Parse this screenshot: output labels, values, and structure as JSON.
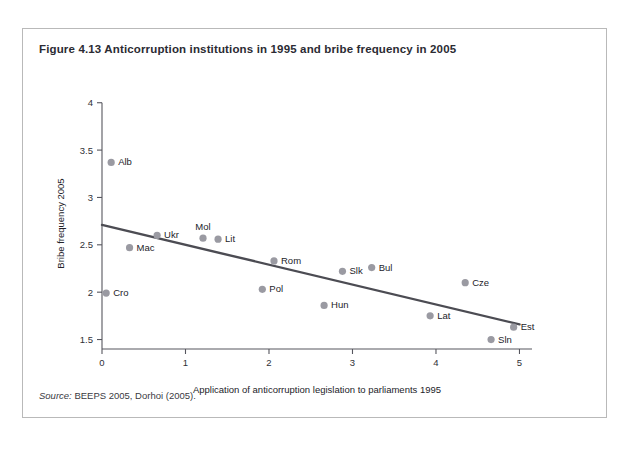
{
  "figure": {
    "title": "Figure 4.13  Anticorruption institutions in 1995 and bribe frequency in 2005",
    "source_label": "Source:",
    "source_text": " BEEPS 2005, Dorhoi (2005)."
  },
  "chart_data": {
    "type": "scatter",
    "title": "Figure 4.13  Anticorruption institutions in 1995 and bribe frequency in 2005",
    "xlabel": "Application of anticorruption legislation to parliaments 1995",
    "ylabel": "Bribe frequency 2005",
    "xlim": [
      0,
      5.15
    ],
    "ylim": [
      1.4,
      4.05
    ],
    "xticks": [
      0,
      1,
      2,
      3,
      4,
      5
    ],
    "xtick_labels": [
      "0",
      "1",
      "2",
      "3",
      "4",
      "5"
    ],
    "yticks": [
      1.5,
      2,
      2.5,
      3,
      3.5,
      4
    ],
    "ytick_labels": [
      "1.5",
      "2",
      "2.5",
      "3",
      "3.5",
      "4"
    ],
    "grid": false,
    "legend": "none",
    "marker_color": "#9a9aa2",
    "trend_color": "#4c4c53",
    "points": [
      {
        "label": "Alb",
        "x": 0.11,
        "y": 3.37,
        "label_dx": 7,
        "label_dy": 3
      },
      {
        "label": "Cro",
        "x": 0.05,
        "y": 1.99,
        "label_dx": 7,
        "label_dy": 3
      },
      {
        "label": "Mac",
        "x": 0.33,
        "y": 2.47,
        "label_dx": 7,
        "label_dy": 3
      },
      {
        "label": "Ukr",
        "x": 0.66,
        "y": 2.6,
        "label_dx": 7,
        "label_dy": 3
      },
      {
        "label": "Mol",
        "x": 1.21,
        "y": 2.57,
        "label_dx": 0,
        "label_dy": -8
      },
      {
        "label": "Lit",
        "x": 1.39,
        "y": 2.56,
        "label_dx": 7,
        "label_dy": 3
      },
      {
        "label": "Pol",
        "x": 1.92,
        "y": 2.03,
        "label_dx": 7,
        "label_dy": 3
      },
      {
        "label": "Rom",
        "x": 2.06,
        "y": 2.33,
        "label_dx": 7,
        "label_dy": 3
      },
      {
        "label": "Hun",
        "x": 2.66,
        "y": 1.86,
        "label_dx": 7,
        "label_dy": 3
      },
      {
        "label": "Slk",
        "x": 2.88,
        "y": 2.22,
        "label_dx": 7,
        "label_dy": 3
      },
      {
        "label": "Bul",
        "x": 3.23,
        "y": 2.26,
        "label_dx": 7,
        "label_dy": 3
      },
      {
        "label": "Lat",
        "x": 3.93,
        "y": 1.75,
        "label_dx": 7,
        "label_dy": 3
      },
      {
        "label": "Cze",
        "x": 4.35,
        "y": 2.1,
        "label_dx": 7,
        "label_dy": 3
      },
      {
        "label": "Sln",
        "x": 4.66,
        "y": 1.5,
        "label_dx": 7,
        "label_dy": 3
      },
      {
        "label": "Est",
        "x": 4.93,
        "y": 1.63,
        "label_dx": 7,
        "label_dy": 3
      }
    ],
    "trend": {
      "x0": 0.0,
      "y0": 2.71,
      "x1": 5.0,
      "y1": 1.66
    }
  }
}
